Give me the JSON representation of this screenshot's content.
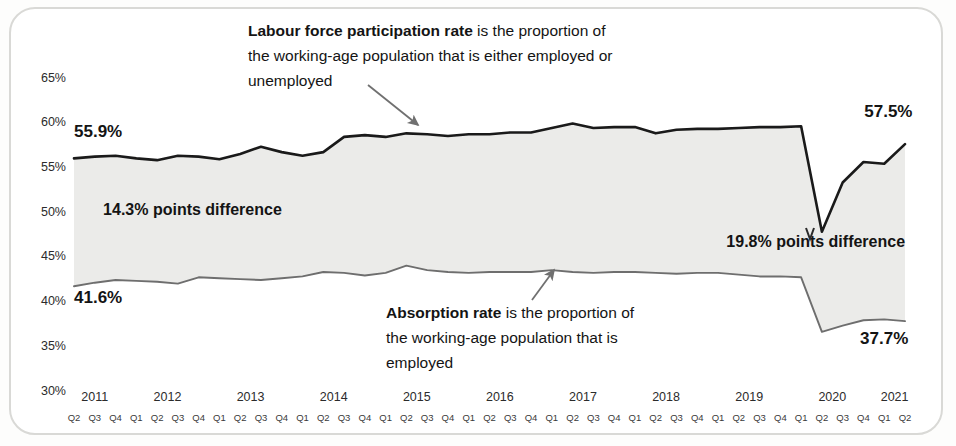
{
  "chart_data": {
    "type": "line",
    "title": "",
    "xlabel": "",
    "ylabel": "",
    "ylim": [
      30,
      65
    ],
    "ytick_labels": [
      "65%",
      "60%",
      "55%",
      "50%",
      "45%",
      "40%",
      "35%",
      "30%"
    ],
    "ytick_values": [
      65,
      60,
      55,
      50,
      45,
      40,
      35,
      30
    ],
    "grid": false,
    "legend_position": "none",
    "years": [
      "2011",
      "2012",
      "2013",
      "2014",
      "2015",
      "2016",
      "2017",
      "2018",
      "2019",
      "2020",
      "2021"
    ],
    "categories": [
      "2011 Q2",
      "2011 Q3",
      "2011 Q4",
      "2012 Q1",
      "2012 Q2",
      "2012 Q3",
      "2012 Q4",
      "2013 Q1",
      "2013 Q2",
      "2013 Q3",
      "2013 Q4",
      "2014 Q1",
      "2014 Q2",
      "2014 Q3",
      "2014 Q4",
      "2015 Q1",
      "2015 Q2",
      "2015 Q3",
      "2015 Q4",
      "2016 Q1",
      "2016 Q2",
      "2016 Q3",
      "2016 Q4",
      "2017 Q1",
      "2017 Q2",
      "2017 Q3",
      "2017 Q4",
      "2018 Q1",
      "2018 Q2",
      "2018 Q3",
      "2018 Q4",
      "2019 Q1",
      "2019 Q2",
      "2019 Q3",
      "2019 Q4",
      "2020 Q1",
      "2020 Q2",
      "2020 Q3",
      "2020 Q4",
      "2021 Q1",
      "2021 Q2"
    ],
    "quarter_ticks": [
      "Q2",
      "Q3",
      "Q4",
      "Q1",
      "Q2",
      "Q3",
      "Q4",
      "Q1",
      "Q2",
      "Q3",
      "Q4",
      "Q1",
      "Q2",
      "Q3",
      "Q4",
      "Q1",
      "Q2",
      "Q3",
      "Q4",
      "Q1",
      "Q2",
      "Q3",
      "Q4",
      "Q1",
      "Q2",
      "Q3",
      "Q4",
      "Q1",
      "Q2",
      "Q3",
      "Q4",
      "Q1",
      "Q2",
      "Q3",
      "Q4",
      "Q1",
      "Q2",
      "Q3",
      "Q4",
      "Q1",
      "Q2"
    ],
    "series": [
      {
        "name": "Labour force participation rate",
        "color": "#1a1a1a",
        "values": [
          55.9,
          56.1,
          56.2,
          55.9,
          55.7,
          56.2,
          56.1,
          55.8,
          56.4,
          57.2,
          56.6,
          56.2,
          56.6,
          58.3,
          58.5,
          58.3,
          58.7,
          58.6,
          58.4,
          58.6,
          58.6,
          58.8,
          58.8,
          59.3,
          59.8,
          59.3,
          59.4,
          59.4,
          58.7,
          59.1,
          59.2,
          59.2,
          59.3,
          59.4,
          59.4,
          59.5,
          47.7,
          53.2,
          55.5,
          55.3,
          57.5
        ]
      },
      {
        "name": "Absorption rate",
        "color": "#6e6e6e",
        "values": [
          41.6,
          42.0,
          42.3,
          42.2,
          42.1,
          41.9,
          42.6,
          42.5,
          42.4,
          42.3,
          42.5,
          42.7,
          43.2,
          43.1,
          42.8,
          43.1,
          43.9,
          43.4,
          43.2,
          43.1,
          43.2,
          43.2,
          43.2,
          43.4,
          43.2,
          43.1,
          43.2,
          43.2,
          43.1,
          43.0,
          43.1,
          43.1,
          42.9,
          42.7,
          42.7,
          42.6,
          36.5,
          37.2,
          37.8,
          37.9,
          37.7
        ]
      }
    ],
    "point_labels": [
      {
        "name": "lfpr-start-label",
        "text": "55.9%",
        "x": 2011.25,
        "y": 58.3
      },
      {
        "name": "lfpr-end-label",
        "text": "57.5%",
        "x": 2021.05,
        "y": 60.5
      },
      {
        "name": "absorption-start-label",
        "text": "41.6%",
        "x": 2011.25,
        "y": 39.7
      },
      {
        "name": "absorption-end-label",
        "text": "37.7%",
        "x": 2021.0,
        "y": 35.1
      }
    ],
    "difference_labels": [
      {
        "name": "difference-label-start",
        "text": "14.3% points difference",
        "x": 2011.6,
        "y": 49.6
      },
      {
        "name": "difference-label-end",
        "text": "19.8% points difference",
        "x": 2019.1,
        "y": 46.0
      }
    ],
    "annotations": [
      {
        "name": "lfpr-annotation",
        "bold_lead": "Labour force participation rate",
        "lines": [
          " is the proportion of",
          "the working-age population that is either employed or",
          "unemployed"
        ],
        "arrow_from": [
          368,
          85
        ],
        "arrow_to": [
          418,
          125
        ]
      },
      {
        "name": "absorption-annotation",
        "bold_lead": "Absorption rate",
        "lines": [
          " is the proportion of",
          "the working-age population that is",
          "employed"
        ],
        "arrow_from": [
          532,
          300
        ],
        "arrow_to": [
          554,
          270
        ]
      }
    ],
    "fill_color": "#ebebe9",
    "background_color": "#ffffff"
  }
}
